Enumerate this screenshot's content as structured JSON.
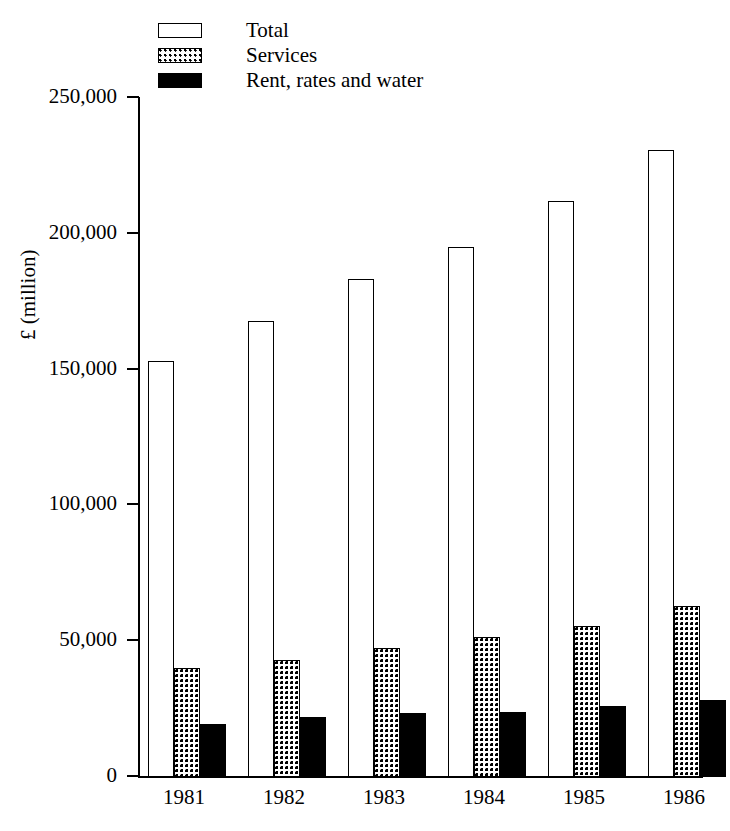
{
  "chart_data": {
    "type": "bar",
    "title": "",
    "xlabel": "",
    "ylabel": "£ (million)",
    "categories": [
      "1981",
      "1982",
      "1983",
      "1984",
      "1985",
      "1986"
    ],
    "series": [
      {
        "name": "Total",
        "values": [
          153000,
          168000,
          183500,
          195000,
          212000,
          231000
        ],
        "fill": "white",
        "pattern": "none"
      },
      {
        "name": "Services",
        "values": [
          40000,
          43000,
          47500,
          51500,
          55500,
          63000
        ],
        "fill": "white",
        "pattern": "dots"
      },
      {
        "name": "Rent, rates and water",
        "values": [
          19500,
          22000,
          23500,
          24000,
          26000,
          28500
        ],
        "fill": "black",
        "pattern": "solid"
      }
    ],
    "ylim": [
      0,
      250000
    ],
    "ytick_values": [
      0,
      50000,
      100000,
      150000,
      200000,
      250000
    ],
    "ytick_labels": [
      "0",
      "50,000",
      "100,000",
      "150,000",
      "200,000",
      "250,000"
    ],
    "grid": false,
    "legend_position": "top-left"
  },
  "legend": {
    "items": [
      {
        "label": "Total",
        "swatch": "legend-swatch-total"
      },
      {
        "label": "Services",
        "swatch": "legend-swatch-services"
      },
      {
        "label": "Rent, rates and water",
        "swatch": "legend-swatch-rent"
      }
    ]
  },
  "axes": {
    "y_axis_label": "£ (million)",
    "y_ticks": [
      "250,000",
      "200,000",
      "150,000",
      "100,000",
      "50,000",
      "0"
    ],
    "x_ticks": [
      "1981",
      "1982",
      "1983",
      "1984",
      "1985",
      "1986"
    ]
  },
  "colors": {
    "ink": "#000000",
    "background": "#ffffff"
  }
}
